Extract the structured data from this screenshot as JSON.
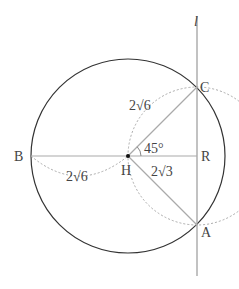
{
  "figure": {
    "line_label": "l",
    "points": {
      "B": "B",
      "H": "H",
      "R": "R",
      "C": "C",
      "A": "A"
    },
    "labels": {
      "HC_length": "2√6",
      "BH_length": "2√6",
      "HR_length": "2√3",
      "angle": "45°"
    },
    "colors": {
      "circle": "#333333",
      "segments": "#aaaaaa",
      "dashed": "#aaaaaa",
      "text": "#444444"
    }
  }
}
